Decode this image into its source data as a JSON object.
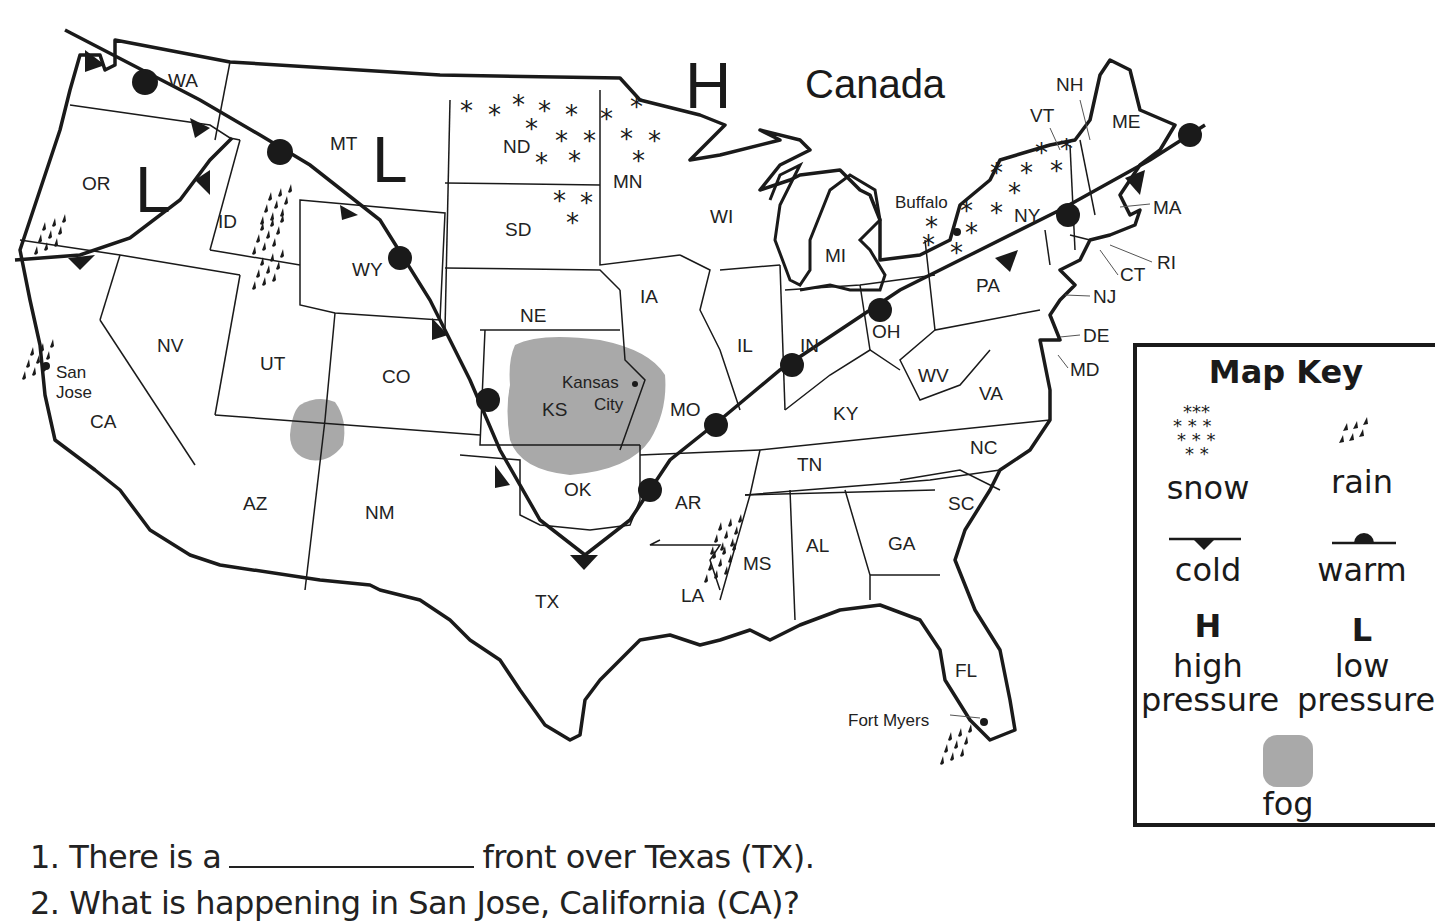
{
  "map": {
    "country_label": "Canada",
    "pressure_markers": [
      {
        "symbol": "H",
        "type": "high",
        "near": "MN/Canada border"
      },
      {
        "symbol": "L",
        "type": "low",
        "near": "OR"
      },
      {
        "symbol": "L",
        "type": "low",
        "near": "MT"
      }
    ],
    "states": [
      "WA",
      "OR",
      "CA",
      "ID",
      "NV",
      "MT",
      "WY",
      "UT",
      "CO",
      "AZ",
      "NM",
      "ND",
      "SD",
      "NE",
      "KS",
      "OK",
      "TX",
      "MN",
      "IA",
      "MO",
      "AR",
      "LA",
      "WI",
      "IL",
      "MS",
      "MI",
      "IN",
      "KY",
      "TN",
      "AL",
      "OH",
      "WV",
      "VA",
      "NC",
      "SC",
      "GA",
      "FL",
      "PA",
      "NY",
      "VT",
      "NH",
      "ME",
      "MA",
      "RI",
      "CT",
      "NJ",
      "DE",
      "MD"
    ],
    "cities": [
      {
        "name": "San Jose",
        "lines": [
          "San",
          "Jose"
        ],
        "weather": "rain"
      },
      {
        "name": "Kansas City",
        "lines": [
          "Kansas",
          "City"
        ],
        "weather": "fog"
      },
      {
        "name": "Buffalo",
        "lines": [
          "Buffalo"
        ],
        "weather": "snow"
      },
      {
        "name": "Fort Myers",
        "lines": [
          "Fort Myers"
        ],
        "weather": "rain"
      }
    ],
    "weather_areas": [
      {
        "type": "snow",
        "region": "ND / MN / SD"
      },
      {
        "type": "snow",
        "region": "NY / VT"
      },
      {
        "type": "rain",
        "region": "OR / northern CA coast"
      },
      {
        "type": "rain",
        "region": "ID / MT"
      },
      {
        "type": "rain",
        "region": "San Jose, CA"
      },
      {
        "type": "rain",
        "region": "MS / LA"
      },
      {
        "type": "rain",
        "region": "Fort Myers, FL"
      },
      {
        "type": "fog",
        "region": "Four Corners (UT/CO/AZ/NM)"
      },
      {
        "type": "fog",
        "region": "KS / Kansas City"
      }
    ],
    "fronts": [
      {
        "type": "mixed cold/warm",
        "path": "WA - MT - WY - CO - KS - TX - AR - MO - IN - OH - PA - NY - MA"
      },
      {
        "type": "cold",
        "path": "ID - OR - northern CA"
      }
    ]
  },
  "map_key": {
    "title": "Map Key",
    "items": [
      {
        "symbol": "snow-icon",
        "label": "snow"
      },
      {
        "symbol": "rain-icon",
        "label": "rain"
      },
      {
        "symbol": "cold-front-icon",
        "label": "cold"
      },
      {
        "symbol": "warm-front-icon",
        "label": "warm"
      },
      {
        "symbol": "H",
        "label_line1": "high",
        "label_line2": "pressure"
      },
      {
        "symbol": "L",
        "label_line1": "low",
        "label_line2": "pressure"
      },
      {
        "symbol": "fog-icon",
        "label": "fog"
      }
    ],
    "fog_color": "#a9a9a9"
  },
  "questions": [
    {
      "number": "1.",
      "before": "There is a",
      "after": "front over Texas (TX)."
    },
    {
      "number": "2.",
      "text": "What is happening in San Jose, California (CA)?"
    }
  ]
}
